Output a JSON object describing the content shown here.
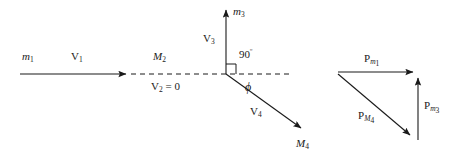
{
  "figure": {
    "stroke_color": "#1a1a1a",
    "background_color": "#ffffff"
  },
  "collision_diagram": {
    "incoming": {
      "mass_label": "m",
      "mass_sub": "1",
      "velocity_label": "V",
      "velocity_sub": "1"
    },
    "target": {
      "mass_label": "M",
      "mass_sub": "2",
      "velocity_label": "V",
      "velocity_sub": "2",
      "velocity_value": " = 0"
    },
    "outgoing_up": {
      "mass_label": "m",
      "mass_sub": "3",
      "velocity_label": "V",
      "velocity_sub": "3"
    },
    "outgoing_down": {
      "mass_label": "M",
      "mass_sub": "4",
      "velocity_label": "V",
      "velocity_sub": "4"
    },
    "angles": {
      "right_angle": "90",
      "right_angle_unit": "º",
      "scatter_angle": "ϕ"
    }
  },
  "momentum_triangle": {
    "top": {
      "symbol": "P",
      "sub_main": "m",
      "sub_index": "1"
    },
    "right": {
      "symbol": "P",
      "sub_main": "m",
      "sub_index": "3"
    },
    "diagonal": {
      "symbol": "P",
      "sub_main": "M",
      "sub_index": "4"
    }
  }
}
